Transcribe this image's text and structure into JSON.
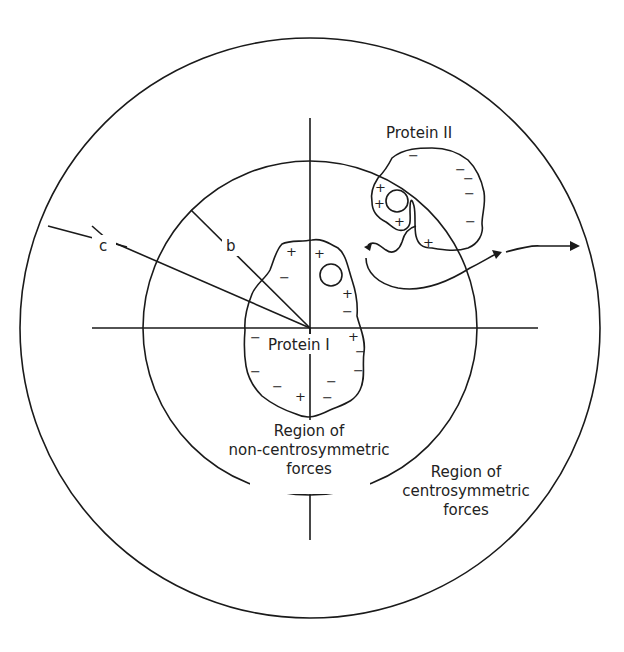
{
  "diagram": {
    "labels": {
      "radius_outer": "c",
      "radius_inner": "b",
      "protein_1": "Protein I",
      "protein_2": "Protein II",
      "inner_region": [
        "Region of",
        "non-centrosymmetric",
        "forces"
      ],
      "outer_region": [
        "Region of",
        "centrosymmetric",
        "forces"
      ]
    },
    "protein_1_charges": {
      "plus": [
        "+",
        "+",
        "+",
        "+",
        "+"
      ],
      "minus": [
        "−",
        "−",
        "−",
        "−",
        "−",
        "−",
        "−",
        "−",
        "−"
      ]
    },
    "protein_2_charges": {
      "plus": [
        "+",
        "+",
        "+",
        "+"
      ],
      "minus": [
        "−",
        "−",
        "−",
        "−",
        "−",
        "−"
      ]
    },
    "colors": {
      "line": "#1a1a1a",
      "background": "#ffffff"
    }
  }
}
